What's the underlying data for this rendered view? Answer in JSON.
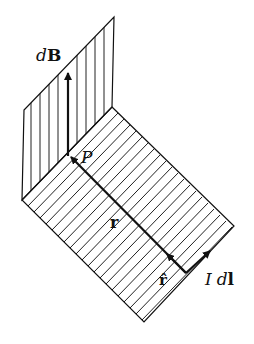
{
  "diagram": {
    "type": "biot-savart-geometry",
    "colors": {
      "ink": "#111111",
      "background": "#ffffff"
    },
    "planes": {
      "vertical": {
        "corners": [
          [
            114,
            17
          ],
          [
            112,
            107
          ],
          [
            22,
            200
          ],
          [
            24,
            110
          ]
        ],
        "hatch": "vertical",
        "hatch_count": 10
      },
      "horizontal": {
        "corners": [
          [
            112,
            107
          ],
          [
            234,
            226
          ],
          [
            144,
            322
          ],
          [
            22,
            200
          ]
        ],
        "hatch": "diagonal",
        "hatch_count": 22
      }
    },
    "vectors": {
      "dB": {
        "from": [
          68,
          156
        ],
        "to": [
          68,
          72
        ]
      },
      "r": {
        "from": [
          186,
          273
        ],
        "to": [
          70,
          156
        ]
      },
      "r_hat": {
        "from": [
          186,
          273
        ],
        "to": [
          166,
          253
        ]
      },
      "Idl": {
        "from": [
          186,
          273
        ],
        "to": [
          211,
          250
        ]
      }
    },
    "labels": {
      "dB_italic": "d",
      "dB_bold": "B",
      "P": "P",
      "r": "r",
      "r_hat": "r̂",
      "Idl_I": "I",
      "Idl_d": "d",
      "Idl_l": "l"
    }
  }
}
